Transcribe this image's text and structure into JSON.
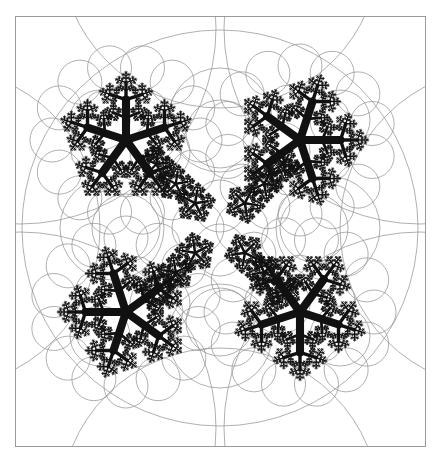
{
  "figure": {
    "title": "Kleinian group limit set with Schottky circle packing",
    "type": "fractal-limit-set",
    "domain": "mathematical-illustration",
    "background_color": "#ffffff",
    "canvas": {
      "width": 444,
      "height": 460
    }
  },
  "frame": {
    "name": "outer-border",
    "x": 15,
    "y": 16,
    "width": 410,
    "height": 430,
    "stroke_color": "#9a9a9a",
    "stroke_width": 1.0,
    "fill": "none"
  },
  "limit_set": {
    "name": "fractal-limit-set",
    "color": "#111111",
    "symmetry": "4-fold dihedral",
    "description": "Dendritic snowflake limit set of a quasi-fuchsian / Kleinian group",
    "center": {
      "x": 220,
      "y": 228
    },
    "radius": 150,
    "depth": 9,
    "branch_count": 5,
    "branch_scale": 0.42,
    "branch_spread_deg": 72,
    "cluster_centers": [
      {
        "x": 126,
        "y": 140,
        "rot_deg": 0
      },
      {
        "x": 300,
        "y": 140,
        "rot_deg": 90
      },
      {
        "x": 300,
        "y": 312,
        "rot_deg": 180
      },
      {
        "x": 126,
        "y": 312,
        "rot_deg": 270
      }
    ],
    "cluster_radius": 88
  },
  "circles": {
    "name": "schottky-circle-packing",
    "stroke_color": "#8e8e8e",
    "stroke_width": 0.7,
    "fill": "none",
    "groups": [
      {
        "label": "outer-enclosing-circle",
        "items": [
          {
            "cx": 220,
            "cy": 228,
            "r": 198
          }
        ]
      },
      {
        "label": "corner-arcs",
        "items": [
          {
            "cx": 20,
            "cy": 28,
            "r": 196
          },
          {
            "cx": 420,
            "cy": 28,
            "r": 196
          },
          {
            "cx": 420,
            "cy": 428,
            "r": 196
          },
          {
            "cx": 20,
            "cy": 428,
            "r": 196
          }
        ]
      },
      {
        "label": "edge-arcs",
        "items": [
          {
            "cx": 220,
            "cy": -52,
            "r": 160
          },
          {
            "cx": 220,
            "cy": 508,
            "r": 160
          },
          {
            "cx": -60,
            "cy": 228,
            "r": 160
          },
          {
            "cx": 500,
            "cy": 228,
            "r": 160
          }
        ]
      },
      {
        "label": "inner-ring-large",
        "items": [
          {
            "cx": 220,
            "cy": 120,
            "r": 52
          },
          {
            "cx": 220,
            "cy": 336,
            "r": 52
          },
          {
            "cx": 112,
            "cy": 228,
            "r": 52
          },
          {
            "cx": 328,
            "cy": 228,
            "r": 52
          }
        ]
      },
      {
        "label": "inner-ring-medium",
        "items": [
          {
            "cx": 160,
            "cy": 152,
            "r": 30
          },
          {
            "cx": 280,
            "cy": 152,
            "r": 30
          },
          {
            "cx": 160,
            "cy": 304,
            "r": 30
          },
          {
            "cx": 280,
            "cy": 304,
            "r": 30
          },
          {
            "cx": 220,
            "cy": 206,
            "r": 26
          },
          {
            "cx": 220,
            "cy": 250,
            "r": 26
          },
          {
            "cx": 198,
            "cy": 228,
            "r": 26
          },
          {
            "cx": 242,
            "cy": 228,
            "r": 26
          }
        ]
      },
      {
        "label": "cluster-halo-circles",
        "per_cluster_count": 14,
        "halo_radius": 74,
        "circle_radius": 22
      },
      {
        "label": "cluster-inner-circles",
        "per_cluster_count": 10,
        "halo_radius": 42,
        "circle_radius": 15
      },
      {
        "label": "mid-band-circles",
        "items": [
          {
            "cx": 126,
            "cy": 228,
            "r": 34
          },
          {
            "cx": 314,
            "cy": 228,
            "r": 34
          },
          {
            "cx": 220,
            "cy": 134,
            "r": 34
          },
          {
            "cx": 220,
            "cy": 322,
            "r": 34
          },
          {
            "cx": 100,
            "cy": 120,
            "r": 30
          },
          {
            "cx": 340,
            "cy": 120,
            "r": 30
          },
          {
            "cx": 100,
            "cy": 336,
            "r": 30
          },
          {
            "cx": 340,
            "cy": 336,
            "r": 30
          }
        ]
      }
    ]
  },
  "labels": {
    "caption": "",
    "axis_labels": [],
    "legend": []
  }
}
